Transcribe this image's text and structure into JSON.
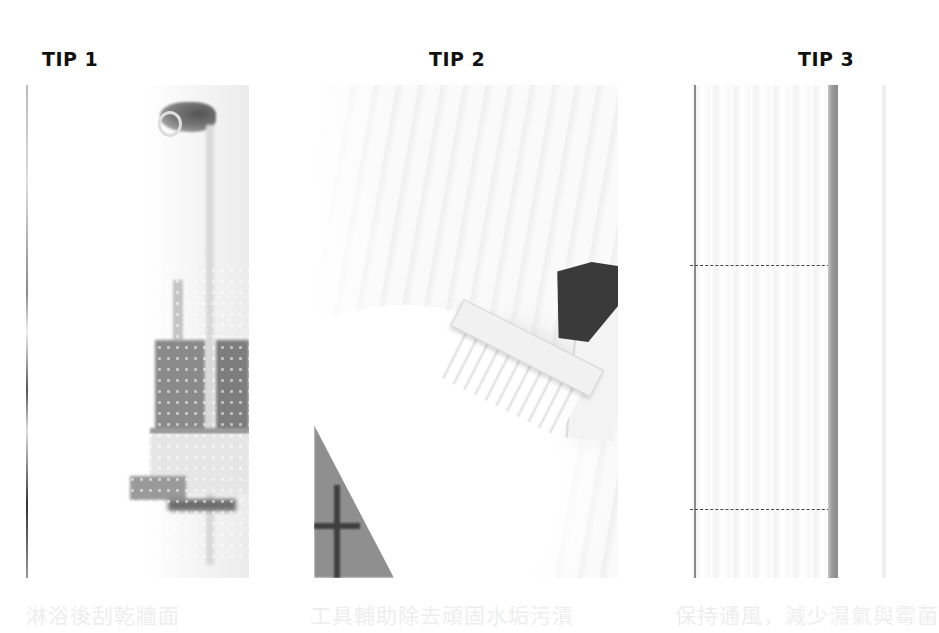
{
  "tips": [
    {
      "title": "TIP 1",
      "caption": "淋浴後刮乾牆面",
      "image": "shower-caddy-behind-wet-glass"
    },
    {
      "title": "TIP 2",
      "caption": "工具輔助除去頑固水垢污漬",
      "image": "brush-scrubbing-bathroom-tiles"
    },
    {
      "title": "TIP 3",
      "caption": "保持通風，減少濕氣與霉菌",
      "image": "clean-tiled-wall-with-grout-lines"
    }
  ],
  "colors": {
    "title": "#111111",
    "caption": "#eeeeee",
    "background": "#ffffff"
  }
}
